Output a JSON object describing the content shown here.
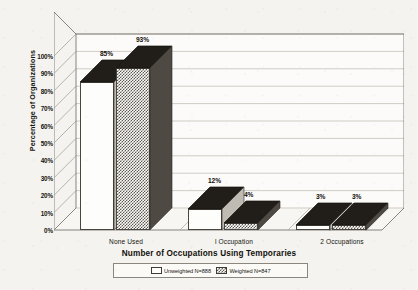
{
  "chart_data": {
    "type": "bar",
    "title": "",
    "xlabel": "Number of Occupations Using Temporaries",
    "ylabel": "Percentage of Organizations",
    "categories": [
      "None Used",
      "l Occupation",
      "2 Occupations"
    ],
    "series": [
      {
        "name": "Unweighted N=888",
        "values": [
          85,
          12,
          3
        ]
      },
      {
        "name": "Weighted N=847",
        "values": [
          93,
          4,
          3
        ]
      }
    ],
    "data_labels": [
      [
        "85%",
        "12%",
        "3%"
      ],
      [
        "93%",
        "4%",
        "3%"
      ]
    ],
    "ylim": [
      0,
      100
    ],
    "ytick_labels": [
      "0%",
      "10%",
      "20%",
      "30%",
      "40%",
      "50%",
      "60%",
      "70%",
      "80%",
      "90%",
      "100%"
    ],
    "ytick_values": [
      0,
      10,
      20,
      30,
      40,
      50,
      60,
      70,
      80,
      90,
      100
    ],
    "grid": true,
    "grid_axis": "y",
    "legend_position": "bottom-center",
    "projection": "3d",
    "series_fill": [
      "hollow-white",
      "checkered-dots"
    ]
  },
  "legend": {
    "entries": [
      {
        "label": "Unweighted N=888",
        "swatch": "hollow-white"
      },
      {
        "label": "Weighted N=847",
        "swatch": "checkered-dots"
      }
    ]
  },
  "colors": {
    "background": "#f4f3ef",
    "axis": "#55514a",
    "grid": "#b9b5ac",
    "bar_top": "#211e19",
    "text": "#15130f"
  }
}
